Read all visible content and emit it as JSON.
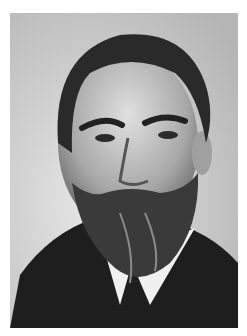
{
  "image": {
    "kind": "black-and-white portrait photograph",
    "subject": "bearded man in dark suit with white collar",
    "colors": {
      "margin": "#ffffff",
      "background": "#c8c8c8",
      "hair": "#2a2a2a",
      "skin": "#bdbdbd",
      "beard": "#3a3a3a",
      "suit": "#1e1e1e",
      "collar": "#f2f2f2"
    }
  }
}
